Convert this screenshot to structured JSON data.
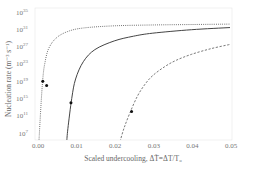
{
  "chart_data": {
    "type": "line",
    "title": "",
    "xlabel": "Scaled undercooling, ΔT̃=ΔT/T₀",
    "ylabel": "Nucleation rate (m⁻³ s⁻¹)",
    "xlim": [
      0.0,
      0.05
    ],
    "ylim_log10": [
      5,
      35
    ],
    "yscale": "log",
    "grid": false,
    "legend": null,
    "x_ticks": [
      "0.00",
      "0.01",
      "0.02",
      "0.03",
      "0.04",
      "0.05"
    ],
    "y_ticks": [
      "10^7",
      "10^11",
      "10^15",
      "10^19",
      "10^23",
      "10^27",
      "10^31",
      "10^35"
    ],
    "series": [
      {
        "name": "dotted",
        "style": "dotted",
        "x": [
          0.0005,
          0.001,
          0.0015,
          0.002,
          0.003,
          0.005,
          0.008,
          0.012,
          0.02,
          0.03,
          0.04,
          0.05
        ],
        "log10_y": [
          5,
          13,
          19.5,
          23,
          26.5,
          29,
          30.5,
          31.3,
          31.8,
          32.0,
          32.1,
          32.2
        ],
        "markers": [
          {
            "x": 0.0015,
            "log10_y": 19
          },
          {
            "x": 0.0025,
            "log10_y": 18
          }
        ]
      },
      {
        "name": "solid",
        "style": "solid",
        "x": [
          0.0077,
          0.008,
          0.009,
          0.01,
          0.012,
          0.015,
          0.02,
          0.025,
          0.03,
          0.04,
          0.05
        ],
        "log10_y": [
          5,
          8,
          15,
          19.5,
          23.5,
          26.3,
          28.3,
          29.4,
          30.1,
          30.9,
          31.4
        ],
        "markers": [
          {
            "x": 0.0088,
            "log10_y": 14
          }
        ]
      },
      {
        "name": "dashed",
        "style": "dashed",
        "x": [
          0.0215,
          0.0225,
          0.024,
          0.026,
          0.028,
          0.03,
          0.033,
          0.036,
          0.04,
          0.045,
          0.05
        ],
        "log10_y": [
          5,
          8,
          11.5,
          15.5,
          18.3,
          20.3,
          22.3,
          23.8,
          25.2,
          26.5,
          27.5
        ],
        "markers": [
          {
            "x": 0.0245,
            "log10_y": 12
          }
        ]
      }
    ]
  }
}
